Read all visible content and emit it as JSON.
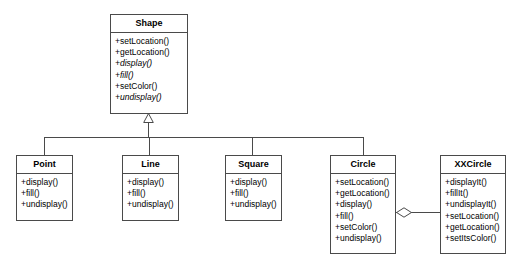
{
  "diagram": {
    "type": "uml-class-diagram",
    "classes": [
      {
        "id": "shape",
        "name": "Shape",
        "abstract": true,
        "members": [
          {
            "text": "+setLocation()",
            "abstract": false
          },
          {
            "text": "+getLocation()",
            "abstract": false
          },
          {
            "text": "+display()",
            "abstract": true
          },
          {
            "text": "+fill()",
            "abstract": true
          },
          {
            "text": "+setColor()",
            "abstract": false
          },
          {
            "text": "+undisplay()",
            "abstract": true
          }
        ]
      },
      {
        "id": "point",
        "name": "Point",
        "abstract": false,
        "members": [
          {
            "text": "+display()",
            "abstract": false
          },
          {
            "text": "+fill()",
            "abstract": false
          },
          {
            "text": "+undisplay()",
            "abstract": false
          }
        ]
      },
      {
        "id": "line",
        "name": "Line",
        "abstract": false,
        "members": [
          {
            "text": "+display()",
            "abstract": false
          },
          {
            "text": "+fill()",
            "abstract": false
          },
          {
            "text": "+undisplay()",
            "abstract": false
          }
        ]
      },
      {
        "id": "square",
        "name": "Square",
        "abstract": false,
        "members": [
          {
            "text": "+display()",
            "abstract": false
          },
          {
            "text": "+fill()",
            "abstract": false
          },
          {
            "text": "+undisplay()",
            "abstract": false
          }
        ]
      },
      {
        "id": "circle",
        "name": "Circle",
        "abstract": false,
        "members": [
          {
            "text": "+setLocation()",
            "abstract": false
          },
          {
            "text": "+getLocation()",
            "abstract": false
          },
          {
            "text": "+display()",
            "abstract": false
          },
          {
            "text": "+fill()",
            "abstract": false
          },
          {
            "text": "+setColor()",
            "abstract": false
          },
          {
            "text": "+undisplay()",
            "abstract": false
          }
        ]
      },
      {
        "id": "xxcircle",
        "name": "XXCircle",
        "abstract": false,
        "members": [
          {
            "text": "+displayIt()",
            "abstract": false
          },
          {
            "text": "+fillIt()",
            "abstract": false
          },
          {
            "text": "+undisplayIt()",
            "abstract": false
          },
          {
            "text": "+setLocation()",
            "abstract": false
          },
          {
            "text": "+getLocation()",
            "abstract": false
          },
          {
            "text": "+setItsColor()",
            "abstract": false
          }
        ]
      }
    ],
    "relationships": [
      {
        "kind": "generalization",
        "from": "point",
        "to": "shape"
      },
      {
        "kind": "generalization",
        "from": "line",
        "to": "shape"
      },
      {
        "kind": "generalization",
        "from": "square",
        "to": "shape"
      },
      {
        "kind": "generalization",
        "from": "circle",
        "to": "shape"
      },
      {
        "kind": "aggregation",
        "from": "circle",
        "to": "xxcircle"
      }
    ],
    "colors": {
      "stroke": "#4a4a4a",
      "fill": "#ffffff",
      "text": "#000000"
    }
  }
}
